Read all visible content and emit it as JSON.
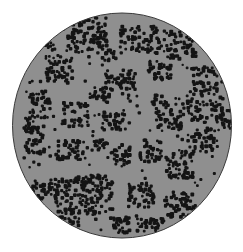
{
  "image": {
    "subject": "Microscopic field of view showing clustered bacterial cells (cocci) on a gray background",
    "field_shape": "circle",
    "colors": {
      "page_background": "#ffffff",
      "field_background": "#8f8f8f",
      "cells": "#141414",
      "field_rim": "#3a3a3a"
    }
  }
}
